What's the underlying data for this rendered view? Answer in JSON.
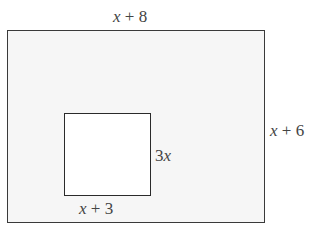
{
  "diagram": {
    "outer_rectangle": {
      "width_label": "x + 8",
      "height_label": "x + 6",
      "fill": "#f6f6f6",
      "stroke": "#3a3a3a"
    },
    "inner_rectangle": {
      "width_label": "x + 3",
      "height_label": "3x",
      "fill": "#ffffff",
      "stroke": "#2a2a2a"
    }
  }
}
